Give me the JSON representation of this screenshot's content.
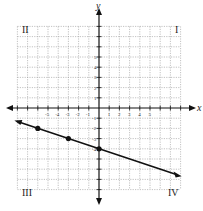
{
  "chart_data": {
    "type": "line",
    "title": "",
    "xlabel": "x",
    "ylabel": "y",
    "xlim": [
      -8,
      8
    ],
    "ylim": [
      -8,
      8
    ],
    "grid": true,
    "x_ticks": [
      "-5",
      "-4",
      "-3",
      "-2",
      "-1",
      "1",
      "2",
      "3",
      "4",
      "5"
    ],
    "y_ticks": [
      "5",
      "4",
      "3",
      "2",
      "1",
      "-1",
      "-2",
      "-3",
      "-4"
    ],
    "quadrants": {
      "I": "I",
      "II": "II",
      "III": "III",
      "IV": "IV"
    },
    "series": [
      {
        "name": "line",
        "equation": "y = -1/3 x - 4",
        "points": [
          [
            -6,
            -2
          ],
          [
            -3,
            -3
          ],
          [
            0,
            -4
          ]
        ],
        "extent": [
          [
            -8,
            -1.33
          ],
          [
            8,
            -6.67
          ]
        ]
      }
    ]
  },
  "labels": {
    "x_axis": "x",
    "y_axis": "y",
    "q1": "I",
    "q2": "II",
    "q3": "III",
    "q4": "IV"
  }
}
